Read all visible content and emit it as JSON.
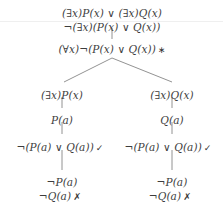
{
  "diagram": {
    "type": "semantic-tableau",
    "notation": {
      "exists": "∃",
      "forall": "∀",
      "negation": "¬",
      "disjunction": "∨",
      "check_mark": "✓",
      "close_mark": "✗",
      "star_mark": "∗"
    },
    "colors": {
      "text": "#3d3d3d",
      "edge": "#767676",
      "background": "#ffffff"
    },
    "nodes": [
      {
        "id": "n1",
        "text": "(∃x)P(x) ∨ (∃x)Q(x)",
        "mark": "",
        "x": 112,
        "y": 8,
        "role": "root-goal"
      },
      {
        "id": "n2",
        "text": "¬(∃x)(P(x) ∨ Q(x))",
        "mark": "",
        "x": 112,
        "y": 22,
        "role": "negated-assumption"
      },
      {
        "id": "n3",
        "text": "(∀x)¬(P(x) ∨ Q(x))",
        "mark": "∗",
        "x": 112,
        "y": 44,
        "role": "quantifier-exchange"
      },
      {
        "id": "n4l",
        "text": "(∃x)P(x)",
        "mark": "",
        "x": 62,
        "y": 90,
        "role": "left-disjunct"
      },
      {
        "id": "n4r",
        "text": "(∃x)Q(x)",
        "mark": "",
        "x": 172,
        "y": 90,
        "role": "right-disjunct"
      },
      {
        "id": "n5l",
        "text": "P(a)",
        "mark": "",
        "x": 62,
        "y": 115,
        "role": "existential-instantiation"
      },
      {
        "id": "n5r",
        "text": "Q(a)",
        "mark": "",
        "x": 172,
        "y": 115,
        "role": "existential-instantiation"
      },
      {
        "id": "n6l",
        "text": "¬(P(a) ∨ Q(a))",
        "mark": "✓",
        "x": 60,
        "y": 142,
        "role": "universal-instantiation"
      },
      {
        "id": "n6r",
        "text": "¬(P(a) ∨ Q(a))",
        "mark": "✓",
        "x": 168,
        "y": 142,
        "role": "universal-instantiation"
      },
      {
        "id": "n7l",
        "text": "¬P(a)",
        "mark": "",
        "x": 62,
        "y": 177,
        "role": "de-morgan-conjunct"
      },
      {
        "id": "n7r",
        "text": "¬P(a)",
        "mark": "",
        "x": 172,
        "y": 177,
        "role": "de-morgan-conjunct"
      },
      {
        "id": "n8l",
        "text": "¬Q(a)",
        "mark": "✗",
        "x": 60,
        "y": 191,
        "role": "closed-branch"
      },
      {
        "id": "n8r",
        "text": "¬Q(a)",
        "mark": "✗",
        "x": 170,
        "y": 191,
        "role": "closed-branch"
      }
    ],
    "edges": [
      {
        "id": "e1",
        "kind": "vertical",
        "x1": 112,
        "y1": 28,
        "x2": 112,
        "y2": 39
      },
      {
        "id": "e2",
        "kind": "branch-left",
        "x1": 112,
        "y1": 58,
        "x2": 64,
        "y2": 82
      },
      {
        "id": "e3",
        "kind": "branch-right",
        "x1": 112,
        "y1": 58,
        "x2": 172,
        "y2": 82
      },
      {
        "id": "e4",
        "kind": "vertical",
        "x1": 62,
        "y1": 97,
        "x2": 62,
        "y2": 108
      },
      {
        "id": "e5",
        "kind": "vertical",
        "x1": 172,
        "y1": 97,
        "x2": 172,
        "y2": 108
      },
      {
        "id": "e6",
        "kind": "vertical",
        "x1": 62,
        "y1": 122,
        "x2": 62,
        "y2": 134
      },
      {
        "id": "e7",
        "kind": "vertical",
        "x1": 172,
        "y1": 122,
        "x2": 172,
        "y2": 134
      },
      {
        "id": "e8",
        "kind": "vertical",
        "x1": 62,
        "y1": 150,
        "x2": 62,
        "y2": 170
      },
      {
        "id": "e9",
        "kind": "vertical",
        "x1": 172,
        "y1": 150,
        "x2": 172,
        "y2": 170
      }
    ]
  }
}
